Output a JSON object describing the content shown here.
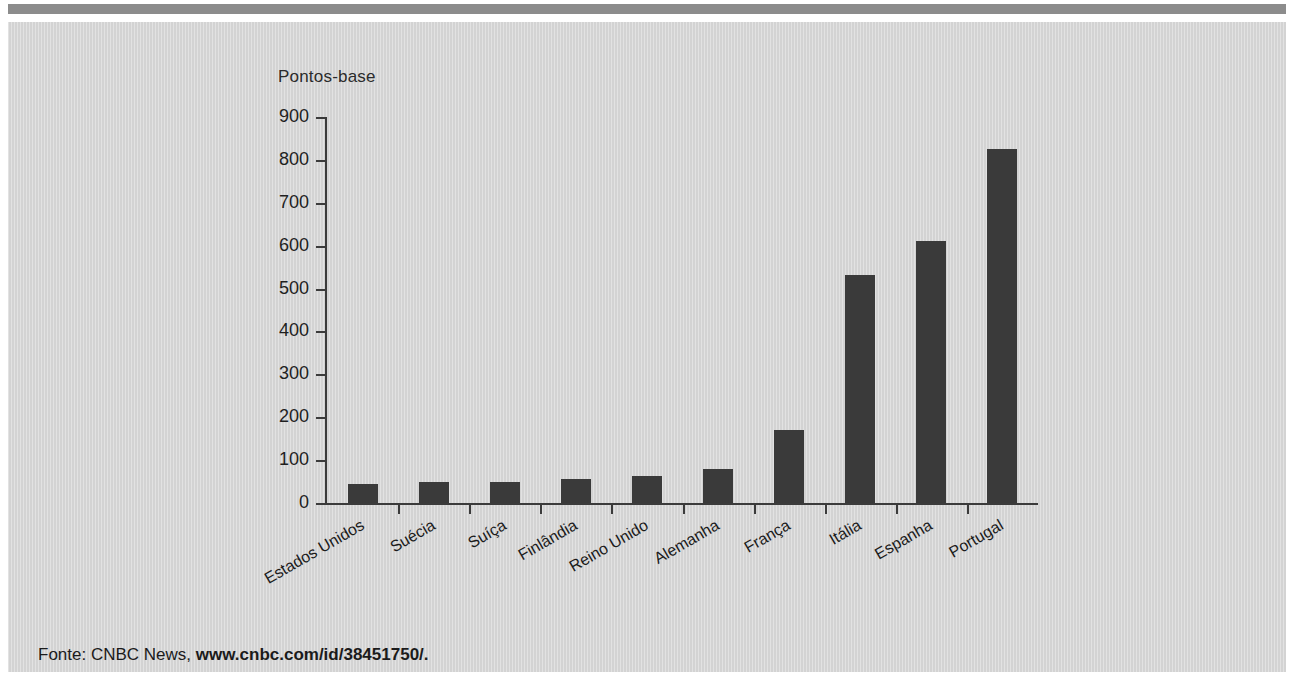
{
  "figure": {
    "source_prefix": "Fonte: CNBC News,",
    "source_url": "www.cnbc.com/id/38451750/."
  },
  "chart_data": {
    "type": "bar",
    "title": "",
    "subtitle": "",
    "ylabel": "Pontos-base",
    "xlabel": "",
    "ylim": [
      0,
      900
    ],
    "yticks": [
      0,
      100,
      200,
      300,
      400,
      500,
      600,
      700,
      800,
      900
    ],
    "ytick_labels": [
      "0",
      "100",
      "200",
      "300",
      "400",
      "500",
      "600",
      "700",
      "800",
      "900"
    ],
    "grid": false,
    "legend": false,
    "bar_color": "#3a3a3a",
    "background_color": "#d6d6d6",
    "categories": [
      "Estados Unidos",
      "Suécia",
      "Suíça",
      "Finlândia",
      "Reino Unido",
      "Alemanha",
      "França",
      "Itália",
      "Espanha",
      "Portugal"
    ],
    "values": [
      45,
      50,
      50,
      57,
      63,
      80,
      170,
      532,
      612,
      825
    ]
  }
}
